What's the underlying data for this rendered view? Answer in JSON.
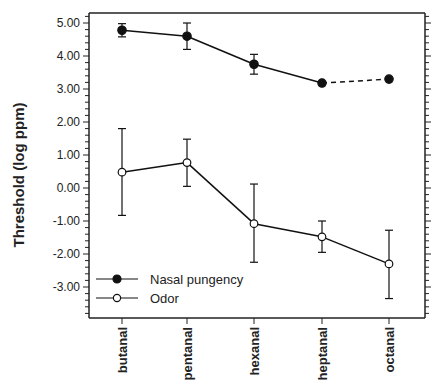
{
  "chart_data": {
    "type": "line",
    "title": "",
    "xlabel": "",
    "ylabel": "Threshold  (log  ppm)",
    "categories": [
      "butanal",
      "pentanal",
      "hexanal",
      "heptanal",
      "octanal"
    ],
    "ylim": [
      -3.94,
      5.3
    ],
    "yticks": [
      5.0,
      4.0,
      3.0,
      2.0,
      1.0,
      0.0,
      -1.0,
      -2.0,
      -3.0
    ],
    "ytick_labels": [
      "5.00",
      "4.00",
      "3.00",
      "2.00",
      "1.00",
      "0.00",
      "-1.00",
      "-2.00",
      "-3.00"
    ],
    "grid": false,
    "legend_position": "lower left",
    "series": [
      {
        "name": "Nasal pungency",
        "marker": "filled-circle",
        "values": [
          4.78,
          4.6,
          3.75,
          3.18,
          3.3
        ],
        "err_low": [
          4.58,
          4.2,
          3.45,
          null,
          null
        ],
        "err_high": [
          4.98,
          5.0,
          4.05,
          null,
          null
        ],
        "dashed_last_segment": true
      },
      {
        "name": "Odor",
        "marker": "open-circle",
        "values": [
          0.48,
          0.77,
          -1.08,
          -1.48,
          -2.3
        ],
        "err_low": [
          -0.83,
          0.05,
          -2.25,
          -1.95,
          -3.35
        ],
        "err_high": [
          1.8,
          1.48,
          0.12,
          -1.0,
          -1.28
        ]
      }
    ]
  },
  "colors": {
    "line": "#111111",
    "axis": "#222222",
    "open_marker_fill": "#ffffff"
  }
}
